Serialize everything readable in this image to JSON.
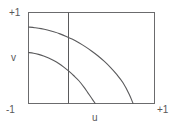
{
  "figure": {
    "title": "",
    "background_color": "#ffffff",
    "line_color": "#5a5a5c",
    "frame_color": "#6b6b6d"
  },
  "axes": {
    "x": {
      "label": "u",
      "min_label": "-1",
      "max_label": "+1",
      "range": [
        -1,
        1
      ]
    },
    "y": {
      "label": "v",
      "min_label": "-1",
      "max_label": "+1",
      "range": [
        -1,
        1
      ]
    }
  },
  "chart_data": {
    "type": "line",
    "title": "",
    "xlabel": "u",
    "ylabel": "v",
    "xlim": [
      -1,
      1
    ],
    "ylim": [
      -1,
      1
    ],
    "grid": false,
    "legend": null,
    "frame": true,
    "annotations": [
      {
        "name": "vertical-reference-line",
        "kind": "vline",
        "x": -0.37,
        "y_from": -1,
        "y_to": 1
      }
    ],
    "series": [
      {
        "name": "upper-curve",
        "x": [
          -1.0,
          -0.9,
          -0.8,
          -0.7,
          -0.6,
          -0.5,
          -0.4,
          -0.3,
          -0.2,
          -0.1,
          0.0,
          0.1,
          0.2,
          0.3,
          0.4,
          0.5,
          0.6,
          0.66
        ],
        "y": [
          0.68,
          0.665,
          0.645,
          0.615,
          0.575,
          0.53,
          0.475,
          0.41,
          0.335,
          0.25,
          0.155,
          0.05,
          -0.07,
          -0.205,
          -0.36,
          -0.545,
          -0.8,
          -1.0
        ]
      },
      {
        "name": "lower-curve",
        "x": [
          -1.0,
          -0.92,
          -0.84,
          -0.76,
          -0.68,
          -0.6,
          -0.52,
          -0.44,
          -0.36,
          -0.28,
          -0.2,
          -0.12,
          -0.06,
          0.0,
          0.06
        ],
        "y": [
          0.12,
          0.105,
          0.08,
          0.045,
          0.0,
          -0.055,
          -0.12,
          -0.2,
          -0.29,
          -0.39,
          -0.5,
          -0.64,
          -0.76,
          -0.88,
          -1.0
        ]
      }
    ]
  }
}
